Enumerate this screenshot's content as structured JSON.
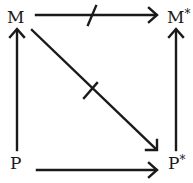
{
  "diagram": {
    "nodes": {
      "M": {
        "label": "M"
      },
      "M_star": {
        "label": "M",
        "sup": "*"
      },
      "P": {
        "label": "P"
      },
      "P_star": {
        "label": "P",
        "sup": "*"
      }
    },
    "edges": [
      {
        "from": "M",
        "to": "M*",
        "crossed": true
      },
      {
        "from": "M",
        "to": "P*",
        "crossed": true
      },
      {
        "from": "P",
        "to": "M",
        "crossed": false
      },
      {
        "from": "P*",
        "to": "M*",
        "crossed": false
      },
      {
        "from": "P",
        "to": "P*",
        "crossed": false
      }
    ],
    "colors": {
      "stroke": "#1a1a1a",
      "background": "#ffffff"
    }
  }
}
